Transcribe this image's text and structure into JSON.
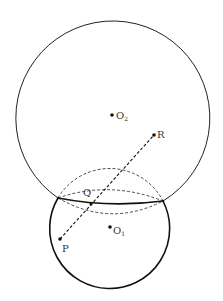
{
  "diagram": {
    "type": "geometry-two-circles",
    "colors": {
      "line": "#222222",
      "point": "#111111",
      "label": "#333333"
    },
    "circles": [
      {
        "id": "O2",
        "label": "O",
        "subscript": "2",
        "cx": 113,
        "cy": 112,
        "r": 97
      },
      {
        "id": "O1",
        "label": "O",
        "subscript": "1",
        "cx": 110,
        "cy": 227,
        "r": 60
      }
    ],
    "points": {
      "O2": {
        "label": "O",
        "subscript": "2",
        "x": 112,
        "y": 115
      },
      "O1": {
        "label": "O",
        "subscript": "1",
        "x": 110,
        "y": 227
      },
      "R": {
        "label": "R",
        "x": 154,
        "y": 135
      },
      "P": {
        "label": "P",
        "x": 60,
        "y": 239
      },
      "Q": {
        "label": "Q",
        "x": 91,
        "y": 204
      }
    },
    "intersections": [
      {
        "x": 58,
        "y": 198
      },
      {
        "x": 163,
        "y": 201
      }
    ],
    "segments": [
      {
        "from": "P",
        "to": "R",
        "style": "dashed"
      }
    ]
  }
}
